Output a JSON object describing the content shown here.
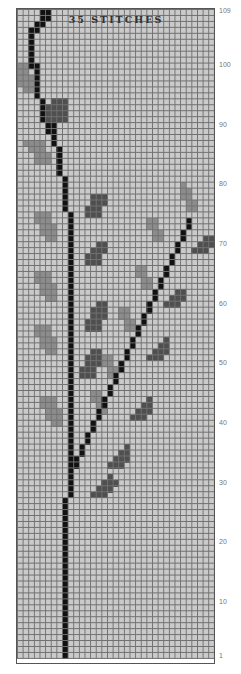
{
  "chart": {
    "title": "",
    "caption": "35 STITCHES",
    "stitches": 35,
    "rows": 109,
    "row_labels": [
      109,
      100,
      90,
      80,
      70,
      60,
      50,
      40,
      30,
      20,
      10,
      1
    ],
    "colors": {
      "background": "#cacaca",
      "grid": "#707070",
      "stem": "#111111",
      "leaf_dark": "#4f4f4f",
      "leaf_light": "#8c8c8c"
    }
  },
  "chart_data": {
    "type": "heatmap",
    "title": "",
    "xlabel": "35 STITCHES",
    "ylabel": "Rows",
    "grid": true,
    "dimensions": {
      "columns": 35,
      "rows": 109
    },
    "row_tick_labels": [
      "109",
      "100",
      "90",
      "80",
      "70",
      "60",
      "50",
      "40",
      "30",
      "20",
      "10",
      "1"
    ],
    "legend": [
      {
        "name": "stem",
        "color": "#111111"
      },
      {
        "name": "dark leaf",
        "color": "#4f4f4f"
      },
      {
        "name": "light leaf",
        "color": "#8c8c8c"
      },
      {
        "name": "background",
        "color": "#cacaca"
      }
    ],
    "stem_runs": [
      {
        "col": 8,
        "from_row": 1,
        "to_row": 27
      },
      {
        "col": 9,
        "from_row": 28,
        "to_row": 75
      },
      {
        "col": 8,
        "from_row": 76,
        "to_row": 81
      },
      {
        "col": 7,
        "from_row": 82,
        "to_row": 86
      },
      {
        "col": 6,
        "from_row": 87,
        "to_row": 90
      },
      {
        "col": 5,
        "from_row": 89,
        "to_row": 90
      },
      {
        "col": 4,
        "from_row": 91,
        "to_row": 94
      },
      {
        "col": 3,
        "from_row": 95,
        "to_row": 100
      },
      {
        "col": 2,
        "from_row": 100,
        "to_row": 106
      },
      {
        "col": 3,
        "from_row": 106,
        "to_row": 107
      },
      {
        "col": 4,
        "from_row": 107,
        "to_row": 108
      },
      {
        "col": 5,
        "from_row": 108,
        "to_row": 109
      },
      {
        "col": 4,
        "from_row": 109,
        "to_row": 109
      }
    ],
    "branch": {
      "start_col": 10,
      "start_row": 33,
      "end_col": 30,
      "end_row": 75,
      "rows_per_col": 2
    },
    "leaves_dark": [
      [
        5,
        91,
        4,
        3
      ],
      [
        6,
        93,
        3,
        2
      ],
      [
        7,
        94,
        2,
        1
      ],
      [
        12,
        75,
        3,
        2
      ],
      [
        13,
        77,
        3,
        2
      ],
      [
        14,
        78,
        2,
        1
      ],
      [
        12,
        67,
        3,
        2
      ],
      [
        13,
        69,
        3,
        1
      ],
      [
        14,
        70,
        2,
        1
      ],
      [
        12,
        56,
        3,
        2
      ],
      [
        13,
        58,
        3,
        2
      ],
      [
        14,
        60,
        2,
        1
      ],
      [
        11,
        48,
        3,
        2
      ],
      [
        12,
        50,
        3,
        2
      ],
      [
        13,
        52,
        2,
        1
      ],
      [
        13,
        28,
        3,
        1
      ],
      [
        14,
        29,
        3,
        1
      ],
      [
        15,
        30,
        3,
        1
      ],
      [
        16,
        31,
        1,
        1
      ],
      [
        16,
        33,
        3,
        1
      ],
      [
        17,
        34,
        3,
        1
      ],
      [
        18,
        35,
        2,
        1
      ],
      [
        19,
        36,
        1,
        1
      ],
      [
        20,
        41,
        3,
        1
      ],
      [
        21,
        42,
        3,
        1
      ],
      [
        22,
        43,
        2,
        1
      ],
      [
        23,
        44,
        1,
        1
      ],
      [
        23,
        51,
        3,
        1
      ],
      [
        24,
        52,
        3,
        1
      ],
      [
        25,
        53,
        2,
        1
      ],
      [
        26,
        54,
        1,
        1
      ],
      [
        26,
        60,
        3,
        1
      ],
      [
        27,
        61,
        3,
        1
      ],
      [
        28,
        62,
        2,
        1
      ],
      [
        31,
        69,
        3,
        1
      ],
      [
        32,
        70,
        3,
        1
      ],
      [
        33,
        71,
        2,
        1
      ]
    ],
    "leaves_light": [
      [
        0,
        97,
        3,
        2
      ],
      [
        0,
        99,
        2,
        2
      ],
      [
        1,
        96,
        2,
        1
      ],
      [
        2,
        86,
        3,
        2
      ],
      [
        3,
        84,
        3,
        2
      ],
      [
        1,
        87,
        3,
        1
      ],
      [
        3,
        74,
        3,
        2
      ],
      [
        4,
        72,
        3,
        2
      ],
      [
        5,
        71,
        2,
        1
      ],
      [
        3,
        64,
        3,
        2
      ],
      [
        4,
        62,
        3,
        2
      ],
      [
        5,
        61,
        2,
        1
      ],
      [
        3,
        55,
        3,
        2
      ],
      [
        4,
        53,
        3,
        2
      ],
      [
        5,
        52,
        2,
        1
      ],
      [
        4,
        43,
        3,
        2
      ],
      [
        5,
        41,
        3,
        2
      ],
      [
        6,
        40,
        2,
        1
      ],
      [
        29,
        78,
        2,
        2
      ],
      [
        30,
        76,
        2,
        2
      ],
      [
        29,
        80,
        1,
        1
      ],
      [
        23,
        73,
        2,
        2
      ],
      [
        24,
        71,
        2,
        2
      ],
      [
        21,
        65,
        2,
        2
      ],
      [
        22,
        63,
        2,
        2
      ],
      [
        18,
        58,
        2,
        2
      ],
      [
        19,
        56,
        2,
        2
      ],
      [
        15,
        50,
        2,
        2
      ],
      [
        16,
        48,
        2,
        2
      ],
      [
        13,
        44,
        2,
        2
      ],
      [
        14,
        42,
        2,
        2
      ]
    ]
  }
}
